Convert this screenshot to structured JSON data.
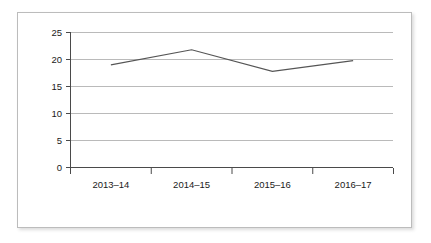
{
  "chart_data": {
    "type": "line",
    "title": "",
    "subtitle": "",
    "xlabel": "",
    "ylabel": "",
    "categories": [
      "2013–14",
      "2014–15",
      "2015–16",
      "2016–17"
    ],
    "values": [
      19,
      21.8,
      17.8,
      19.8
    ],
    "series": [
      {
        "name": "",
        "values": [
          19,
          21.8,
          17.8,
          19.8
        ]
      }
    ],
    "ylim": [
      0,
      25
    ],
    "yticks": [
      0,
      5,
      10,
      15,
      20,
      25
    ],
    "ytick_labels": [
      "0",
      "5",
      "10",
      "15",
      "20",
      "25"
    ],
    "xtick_labels": [
      "2013–14",
      "2014–15",
      "2015–16",
      "2016–17"
    ],
    "grid": true,
    "grid_axis": "y",
    "legend": false,
    "legend_position": "none",
    "annotations": []
  },
  "style": {
    "line_color": "#555555",
    "grid_color": "#a8a8a8",
    "axis_color": "#4a4a4a",
    "text_color": "#1a1a1a",
    "frame_color": "#bcbcbc",
    "background": "#ffffff"
  },
  "axis": {
    "y_tick_0": "0",
    "y_tick_1": "5",
    "y_tick_2": "10",
    "y_tick_3": "15",
    "y_tick_4": "20",
    "y_tick_5": "25",
    "x_tick_0": "2013–14",
    "x_tick_1": "2014–15",
    "x_tick_2": "2015–16",
    "x_tick_3": "2016–17"
  }
}
